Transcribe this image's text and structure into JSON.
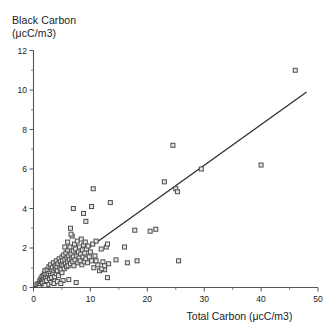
{
  "chart_data": {
    "type": "scatter",
    "title": "",
    "ylabel": "Black Carbon\n(μcC/m3)",
    "ylabel_line1": "Black Carbon",
    "ylabel_line2": "(μcC/m3)",
    "xlabel": "Total Carbon (μcC/m3)",
    "xlim": [
      0,
      50
    ],
    "ylim": [
      0,
      12
    ],
    "xticks": [
      0,
      10,
      20,
      30,
      40,
      50
    ],
    "xticklabels": [
      "0",
      "10",
      "20",
      "30",
      "40",
      "50"
    ],
    "xminorticks": [
      5,
      15,
      25,
      35,
      45
    ],
    "yticks": [
      0,
      2,
      4,
      6,
      8,
      10,
      12
    ],
    "yticklabels": [
      "0",
      "2",
      "4",
      "6",
      "8",
      "10",
      "12"
    ],
    "yminorticks": [
      1,
      3,
      5,
      7,
      9,
      11
    ],
    "grid": false,
    "legend": false,
    "marker": "open-square",
    "marker_size": 4,
    "marker_color": "#4d4d4d",
    "line_color": "#2b2b2b",
    "trendline": {
      "x0": 0.0,
      "y0": 0.0,
      "x1": 48.0,
      "y1": 9.9,
      "slope": 0.206
    },
    "points": [
      [
        0.6,
        0.15
      ],
      [
        0.8,
        0.2
      ],
      [
        1.0,
        0.1
      ],
      [
        1.1,
        0.35
      ],
      [
        1.2,
        0.2
      ],
      [
        1.3,
        0.45
      ],
      [
        1.4,
        0.3
      ],
      [
        1.5,
        0.55
      ],
      [
        1.6,
        0.25
      ],
      [
        1.7,
        0.6
      ],
      [
        1.8,
        0.4
      ],
      [
        1.9,
        0.7
      ],
      [
        2.0,
        0.3
      ],
      [
        2.0,
        0.85
      ],
      [
        2.1,
        0.5
      ],
      [
        2.2,
        0.65
      ],
      [
        2.3,
        0.35
      ],
      [
        2.4,
        0.9
      ],
      [
        2.5,
        0.55
      ],
      [
        2.6,
        0.7
      ],
      [
        2.7,
        1.05
      ],
      [
        2.8,
        0.45
      ],
      [
        2.9,
        0.8
      ],
      [
        3.0,
        0.6
      ],
      [
        3.0,
        1.15
      ],
      [
        3.1,
        0.9
      ],
      [
        3.2,
        0.5
      ],
      [
        3.3,
        1.0
      ],
      [
        3.4,
        0.7
      ],
      [
        3.5,
        1.25
      ],
      [
        3.6,
        0.85
      ],
      [
        3.7,
        0.55
      ],
      [
        3.8,
        1.1
      ],
      [
        3.9,
        0.95
      ],
      [
        4.0,
        0.7
      ],
      [
        4.0,
        1.35
      ],
      [
        4.1,
        1.05
      ],
      [
        4.2,
        0.85
      ],
      [
        4.3,
        1.2
      ],
      [
        4.4,
        0.6
      ],
      [
        4.5,
        1.45
      ],
      [
        4.6,
        1.0
      ],
      [
        4.7,
        1.3
      ],
      [
        4.8,
        0.9
      ],
      [
        4.9,
        1.15
      ],
      [
        5.0,
        1.55
      ],
      [
        5.0,
        0.75
      ],
      [
        5.1,
        1.35
      ],
      [
        5.2,
        1.1
      ],
      [
        5.3,
        1.65
      ],
      [
        5.4,
        0.95
      ],
      [
        5.5,
        1.4
      ],
      [
        5.6,
        1.2
      ],
      [
        5.7,
        1.75
      ],
      [
        5.8,
        1.05
      ],
      [
        5.9,
        1.5
      ],
      [
        6.0,
        1.3
      ],
      [
        6.0,
        1.9
      ],
      [
        6.1,
        1.1
      ],
      [
        6.2,
        1.6
      ],
      [
        6.3,
        1.4
      ],
      [
        6.4,
        2.05
      ],
      [
        6.5,
        1.2
      ],
      [
        6.6,
        1.7
      ],
      [
        6.7,
        1.45
      ],
      [
        6.8,
        2.6
      ],
      [
        6.9,
        1.3
      ],
      [
        7.0,
        1.85
      ],
      [
        7.0,
        1.55
      ],
      [
        7.1,
        1.1
      ],
      [
        7.2,
        2.2
      ],
      [
        7.3,
        1.4
      ],
      [
        7.4,
        1.95
      ],
      [
        7.5,
        0.25
      ],
      [
        7.6,
        1.6
      ],
      [
        7.7,
        2.35
      ],
      [
        7.8,
        1.25
      ],
      [
        7.9,
        1.8
      ],
      [
        8.0,
        1.5
      ],
      [
        8.1,
        2.05
      ],
      [
        8.2,
        1.35
      ],
      [
        8.3,
        1.7
      ],
      [
        8.4,
        2.45
      ],
      [
        8.5,
        1.15
      ],
      [
        8.6,
        1.9
      ],
      [
        8.7,
        1.55
      ],
      [
        8.8,
        2.15
      ],
      [
        8.9,
        1.3
      ],
      [
        9.0,
        1.75
      ],
      [
        9.1,
        2.3
      ],
      [
        9.2,
        1.45
      ],
      [
        9.3,
        1.95
      ],
      [
        9.5,
        1.25
      ],
      [
        9.6,
        2.1
      ],
      [
        9.8,
        1.55
      ],
      [
        10.0,
        1.8
      ],
      [
        10.2,
        1.35
      ],
      [
        10.4,
        2.2
      ],
      [
        10.6,
        1.0
      ],
      [
        10.8,
        1.6
      ],
      [
        11.0,
        2.35
      ],
      [
        11.3,
        1.15
      ],
      [
        11.6,
        0.85
      ],
      [
        11.9,
        1.95
      ],
      [
        12.2,
        1.3
      ],
      [
        12.5,
        0.9
      ],
      [
        12.8,
        2.05
      ],
      [
        13.0,
        2.2
      ],
      [
        13.2,
        1.2
      ],
      [
        5.5,
        2.05
      ],
      [
        6.0,
        2.3
      ],
      [
        6.5,
        3.0
      ],
      [
        6.6,
        2.7
      ],
      [
        7.0,
        4.0
      ],
      [
        9.2,
        3.35
      ],
      [
        8.8,
        3.75
      ],
      [
        10.5,
        5.0
      ],
      [
        11.0,
        1.35
      ],
      [
        12.0,
        0.95
      ],
      [
        12.5,
        1.1
      ],
      [
        13.0,
        0.5
      ],
      [
        13.5,
        4.3
      ],
      [
        10.2,
        4.1
      ],
      [
        14.5,
        1.4
      ],
      [
        16.0,
        2.05
      ],
      [
        16.5,
        1.25
      ],
      [
        17.8,
        2.9
      ],
      [
        18.2,
        1.35
      ],
      [
        20.5,
        2.85
      ],
      [
        23.0,
        5.35
      ],
      [
        24.5,
        7.2
      ],
      [
        25.0,
        5.0
      ],
      [
        25.3,
        4.85
      ],
      [
        25.5,
        1.35
      ],
      [
        29.5,
        6.0
      ],
      [
        40.0,
        6.2
      ],
      [
        46.0,
        11.0
      ],
      [
        21.5,
        2.95
      ],
      [
        3.0,
        0.25
      ],
      [
        3.6,
        0.2
      ],
      [
        4.2,
        0.3
      ],
      [
        2.5,
        0.15
      ],
      [
        5.2,
        0.35
      ],
      [
        6.2,
        0.4
      ],
      [
        4.8,
        0.2
      ],
      [
        2.0,
        0.1
      ]
    ]
  }
}
